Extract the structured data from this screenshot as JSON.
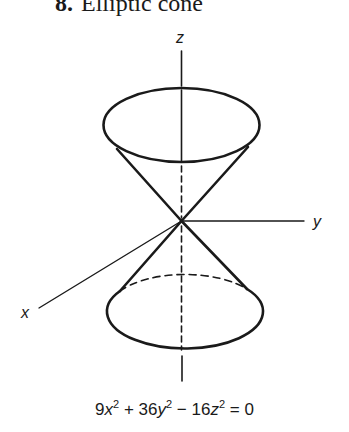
{
  "title": {
    "number": "8.",
    "text": "Elliptic cone"
  },
  "axes": {
    "x_label": "x",
    "y_label": "y",
    "z_label": "z"
  },
  "equation": {
    "terms": [
      {
        "coef": "9",
        "var": "x",
        "exp": "2"
      },
      {
        "op": "+",
        "coef": "36",
        "var": "y",
        "exp": "2"
      },
      {
        "op": "−",
        "coef": "16",
        "var": "z",
        "exp": "2"
      }
    ],
    "rhs": "= 0",
    "full_text": "9x² + 36y² − 16z² = 0"
  },
  "colors": {
    "ink": "#1a1a1a",
    "background": "#ffffff"
  }
}
